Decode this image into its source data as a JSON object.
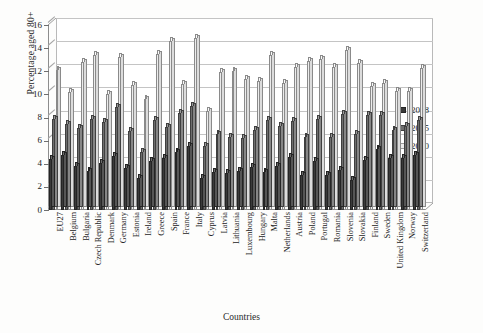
{
  "chart_data": {
    "type": "bar",
    "title": "",
    "xlabel": "Countries",
    "ylabel": "Percentage aged 80+",
    "ylim": [
      0,
      16
    ],
    "yticks": [
      0,
      2,
      4,
      6,
      8,
      10,
      12,
      14,
      16
    ],
    "grid": true,
    "legend_position": "right",
    "categories": [
      "EU27",
      "Belgium",
      "Bulgaria",
      "Czech Republic",
      "Denmark",
      "Germany",
      "Estonia",
      "Ireland",
      "Greece",
      "Spain",
      "France",
      "Italy",
      "Cyprus",
      "Latvia",
      "Lithuania",
      "Luxembourg",
      "Hungary",
      "Malta",
      "Netherlands",
      "Austria",
      "Poland",
      "Portugal",
      "Romania",
      "Slovenia",
      "Slovakia",
      "Finland",
      "Sweden",
      "United Kingdom",
      "Norway",
      "Switzerland"
    ],
    "series": [
      {
        "name": "2008",
        "color": "#3a3a3a",
        "values": [
          4.4,
          4.8,
          3.8,
          3.4,
          4.1,
          4.7,
          3.6,
          2.8,
          4.2,
          4.5,
          5.0,
          5.5,
          2.8,
          3.3,
          3.2,
          3.4,
          3.7,
          3.3,
          3.8,
          4.6,
          3.0,
          4.2,
          3.0,
          3.5,
          2.6,
          4.3,
          5.3,
          4.5,
          4.5,
          4.8
        ]
      },
      {
        "name": "2035",
        "color": "#6e6e6e",
        "values": [
          7.9,
          7.4,
          7.1,
          7.9,
          7.6,
          8.9,
          6.8,
          5.0,
          7.8,
          7.2,
          8.4,
          9.0,
          5.5,
          6.6,
          6.3,
          6.2,
          6.9,
          7.8,
          7.3,
          7.7,
          6.3,
          7.9,
          6.3,
          8.3,
          6.6,
          8.2,
          8.2,
          6.9,
          7.3,
          7.8
        ]
      },
      {
        "name": "2060",
        "color": "#ececec",
        "values": [
          12.1,
          10.2,
          12.8,
          13.4,
          10.0,
          13.2,
          10.8,
          9.6,
          13.5,
          14.6,
          10.9,
          14.9,
          8.6,
          11.9,
          12.0,
          11.3,
          11.2,
          13.4,
          11.0,
          12.4,
          12.9,
          13.1,
          12.4,
          13.8,
          12.7,
          10.7,
          11.0,
          10.3,
          10.3,
          12.3
        ]
      }
    ]
  },
  "legend": {
    "entries": [
      {
        "label": "2008"
      },
      {
        "label": "2035"
      },
      {
        "label": "2060"
      }
    ]
  }
}
